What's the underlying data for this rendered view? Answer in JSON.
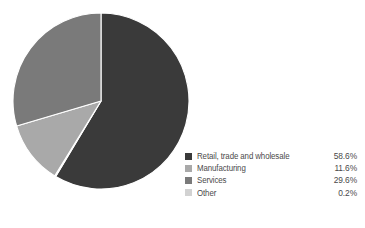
{
  "chart_data": {
    "type": "pie",
    "title": "",
    "subtitle": "",
    "xlabel": "",
    "ylabel": "",
    "grid": false,
    "legend_position": "bottom-right",
    "value_suffix": "%",
    "start_angle_deg": 0,
    "direction": "clockwise",
    "categories": [
      "Retail, trade and wholesale",
      "Manufacturing",
      "Services",
      "Other"
    ],
    "values": [
      58.6,
      11.6,
      29.6,
      0.2
    ],
    "value_labels": [
      "58.6%",
      "11.6%",
      "29.6%",
      "0.2%"
    ],
    "colors": [
      "#3a3a3a",
      "#a9a9a9",
      "#7a7a7a",
      "#d2d2d2"
    ],
    "slices": [
      {
        "label": "Retail, trade and wholesale",
        "value": 58.6,
        "value_label": "58.6%",
        "color": "#3a3a3a",
        "swatch_name": "legend-swatch-retail"
      },
      {
        "label": "Manufacturing",
        "value": 11.6,
        "value_label": "11.6%",
        "color": "#a9a9a9",
        "swatch_name": "legend-swatch-manufacturing"
      },
      {
        "label": "Services",
        "value": 29.6,
        "value_label": "29.6%",
        "color": "#7a7a7a",
        "swatch_name": "legend-swatch-services"
      },
      {
        "label": "Other",
        "value": 0.2,
        "value_label": "0.2%",
        "color": "#d2d2d2",
        "swatch_name": "legend-swatch-other"
      }
    ],
    "geometry": {
      "center_x": 89,
      "center_y": 90,
      "radius": 88,
      "separator_color": "#ffffff",
      "separator_width": 1.1
    },
    "background_color": "#ffffff",
    "text_color": "#4a4a4a"
  }
}
